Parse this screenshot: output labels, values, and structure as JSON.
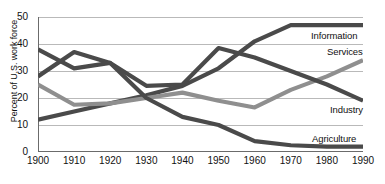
{
  "chart_data": {
    "type": "line",
    "title": "",
    "xlabel": "",
    "ylabel": "Percent of U.S. work force",
    "x": [
      1900,
      1910,
      1920,
      1930,
      1940,
      1950,
      1960,
      1970,
      1980,
      1990
    ],
    "xlim": [
      1900,
      1990
    ],
    "ylim": [
      0,
      50
    ],
    "yticks": [
      0,
      10,
      20,
      30,
      40,
      50
    ],
    "xticks": [
      "1900",
      "1910",
      "1920",
      "1930",
      "1940",
      "1950",
      "1960",
      "1970",
      "1980",
      "1990"
    ],
    "ytick_labels": [
      "50",
      "40",
      "30",
      "20",
      "10",
      "0"
    ],
    "grid": true,
    "legend_position": "right-inline",
    "series": [
      {
        "name": "Information",
        "color": "#4a4a4a",
        "values": [
          12,
          15,
          18,
          21,
          24.5,
          31,
          41,
          47,
          47,
          47
        ]
      },
      {
        "name": "Services",
        "color": "#8f8f8f",
        "values": [
          25,
          17.5,
          18,
          20,
          22,
          19,
          16.5,
          23,
          28,
          34
        ]
      },
      {
        "name": "Industry",
        "color": "#4a4a4a",
        "values": [
          28,
          37,
          33,
          24.5,
          25,
          38.5,
          35,
          30,
          25,
          19
        ]
      },
      {
        "name": "Agriculture",
        "color": "#4a4a4a",
        "values": [
          38,
          31,
          33,
          20,
          13,
          10,
          4,
          2.5,
          2,
          2
        ]
      }
    ]
  },
  "labels": {
    "information": "Information",
    "services": "Services",
    "industry": "Industry",
    "agriculture": "Agriculture"
  },
  "colors": {
    "dark_line": "#4a4a4a",
    "gray_line": "#8f8f8f",
    "grid": "#b9b9b9",
    "axis": "#6b6b6b",
    "text": "#111111"
  }
}
